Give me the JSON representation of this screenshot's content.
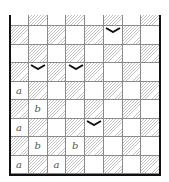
{
  "diagram": {
    "columns": 8,
    "full_rows": 8,
    "partial_top_row": true,
    "hatch_color": "#c2c2c2",
    "grid_color": "#8a8a8a",
    "wall_color": "#111111",
    "label_color": "#555555",
    "labels": [
      {
        "row": 3,
        "col": 0,
        "text": "a"
      },
      {
        "row": 4,
        "col": 1,
        "text": "b"
      },
      {
        "row": 5,
        "col": 0,
        "text": "a"
      },
      {
        "row": 6,
        "col": 1,
        "text": "b"
      },
      {
        "row": 6,
        "col": 3,
        "text": "b"
      },
      {
        "row": 7,
        "col": 0,
        "text": "a"
      },
      {
        "row": 7,
        "col": 2,
        "text": "a"
      }
    ],
    "chevrons": [
      {
        "row": 0,
        "col": 5
      },
      {
        "row": 2,
        "col": 1
      },
      {
        "row": 2,
        "col": 3
      },
      {
        "row": 5,
        "col": 4
      }
    ]
  }
}
